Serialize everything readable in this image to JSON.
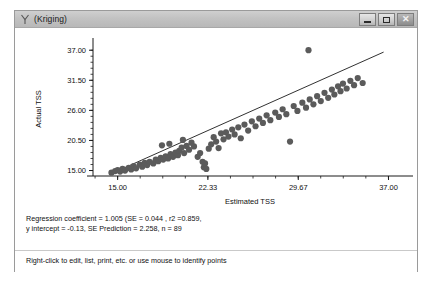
{
  "window": {
    "title": "(Kriging)",
    "title_icon": "y-variable-icon",
    "controls": {
      "minimize": "minimize-icon",
      "maximize": "maximize-icon",
      "close": "close-icon"
    }
  },
  "stats": {
    "line1": "Regression coefficient = 1.005 (SE = 0.044 , r2 =0.859,",
    "line2": "y intercept = -0.13, SE Prediction = 2.258, n = 89"
  },
  "hint": "Right-click to edit, list, print, etc. or use mouse to identify points",
  "chart_data": {
    "type": "scatter",
    "title": "",
    "xlabel": "Estimated TSS",
    "ylabel": "Actual TSS",
    "xlim": [
      13.0,
      38.5
    ],
    "ylim": [
      14.0,
      38.5
    ],
    "xticks": [
      "15.00",
      "22.33",
      "29.67",
      "37.00"
    ],
    "xtick_values": [
      15.0,
      22.33,
      29.67,
      37.0
    ],
    "yticks": [
      "15.00",
      "20.50",
      "26.00",
      "31.50",
      "37.00"
    ],
    "ytick_values": [
      15.0,
      20.5,
      26.0,
      31.5,
      37.0
    ],
    "minor_ticks": true,
    "grid": false,
    "marker_color": "#5b5b5b",
    "line_color": "#1a1a1a",
    "fit_line": {
      "slope": 1.005,
      "intercept": -0.13,
      "x_start": 14.3,
      "x_end": 36.6
    },
    "n": 89,
    "points": [
      [
        14.5,
        14.6
      ],
      [
        14.8,
        14.9
      ],
      [
        15.0,
        15.1
      ],
      [
        15.2,
        14.8
      ],
      [
        15.4,
        15.3
      ],
      [
        15.6,
        15.0
      ],
      [
        15.9,
        15.5
      ],
      [
        16.1,
        15.2
      ],
      [
        16.3,
        15.8
      ],
      [
        16.5,
        15.4
      ],
      [
        16.8,
        16.1
      ],
      [
        17.0,
        15.7
      ],
      [
        17.2,
        16.4
      ],
      [
        17.4,
        16.0
      ],
      [
        17.6,
        16.6
      ],
      [
        17.9,
        16.3
      ],
      [
        18.1,
        17.0
      ],
      [
        18.3,
        16.7
      ],
      [
        18.5,
        17.3
      ],
      [
        18.7,
        17.0
      ],
      [
        18.9,
        17.6
      ],
      [
        19.1,
        17.2
      ],
      [
        19.3,
        18.0
      ],
      [
        19.5,
        17.5
      ],
      [
        19.7,
        18.3
      ],
      [
        19.9,
        17.8
      ],
      [
        18.6,
        19.6
      ],
      [
        19.2,
        19.9
      ],
      [
        20.0,
        18.6
      ],
      [
        20.2,
        19.2
      ],
      [
        20.4,
        18.2
      ],
      [
        20.6,
        19.5
      ],
      [
        20.8,
        18.8
      ],
      [
        21.0,
        20.1
      ],
      [
        21.2,
        19.4
      ],
      [
        20.3,
        20.6
      ],
      [
        21.5,
        17.5
      ],
      [
        21.7,
        18.2
      ],
      [
        21.9,
        16.6
      ],
      [
        22.0,
        15.6
      ],
      [
        22.2,
        15.3
      ],
      [
        22.1,
        16.3
      ],
      [
        22.4,
        19.0
      ],
      [
        22.6,
        19.8
      ],
      [
        22.8,
        21.1
      ],
      [
        23.0,
        20.3
      ],
      [
        23.2,
        19.1
      ],
      [
        23.4,
        21.8
      ],
      [
        23.6,
        20.7
      ],
      [
        23.8,
        22.0
      ],
      [
        24.0,
        21.2
      ],
      [
        24.3,
        22.5
      ],
      [
        24.5,
        21.6
      ],
      [
        24.8,
        22.9
      ],
      [
        25.0,
        20.9
      ],
      [
        25.3,
        23.4
      ],
      [
        25.6,
        22.3
      ],
      [
        25.9,
        24.0
      ],
      [
        26.2,
        23.1
      ],
      [
        26.5,
        24.5
      ],
      [
        26.8,
        23.7
      ],
      [
        27.1,
        25.1
      ],
      [
        27.4,
        24.2
      ],
      [
        27.8,
        25.6
      ],
      [
        28.1,
        24.8
      ],
      [
        28.4,
        26.2
      ],
      [
        28.7,
        25.3
      ],
      [
        29.0,
        20.3
      ],
      [
        29.3,
        26.8
      ],
      [
        29.6,
        25.9
      ],
      [
        30.0,
        27.4
      ],
      [
        30.3,
        26.5
      ],
      [
        30.6,
        28.0
      ],
      [
        30.9,
        27.1
      ],
      [
        31.2,
        28.6
      ],
      [
        31.5,
        27.7
      ],
      [
        31.8,
        29.2
      ],
      [
        32.1,
        28.3
      ],
      [
        32.4,
        29.8
      ],
      [
        32.6,
        28.9
      ],
      [
        32.9,
        30.4
      ],
      [
        33.1,
        29.5
      ],
      [
        33.3,
        30.9
      ],
      [
        33.6,
        30.0
      ],
      [
        33.9,
        31.4
      ],
      [
        34.2,
        30.6
      ],
      [
        34.5,
        31.9
      ],
      [
        34.9,
        31.0
      ],
      [
        30.5,
        37.0
      ]
    ]
  }
}
